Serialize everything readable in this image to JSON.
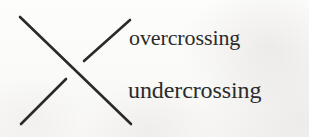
{
  "figure": {
    "name": "crossing-diagram",
    "caption_absent": true,
    "background_color": "#fbfbfa",
    "ink_color": "#2a2a2a"
  },
  "diagram": {
    "type": "knot-crossing",
    "crossing_point": {
      "x": 75,
      "y": 70
    },
    "strands": [
      {
        "id": "overcrossing-strand",
        "role": "overcrossing",
        "direction": "upper-left-to-lower-right",
        "start": {
          "x": 20,
          "y": 17
        },
        "end": {
          "x": 131,
          "y": 124
        },
        "broken": false,
        "stroke_width": 2.6,
        "color": "#2a2a2a"
      },
      {
        "id": "undercrossing-strand",
        "role": "undercrossing",
        "direction": "upper-right-to-lower-left",
        "start": {
          "x": 130,
          "y": 20
        },
        "end": {
          "x": 21,
          "y": 124
        },
        "broken": true,
        "break_start": {
          "x": 84,
          "y": 61
        },
        "break_end": {
          "x": 66,
          "y": 79
        },
        "stroke_width": 2.6,
        "color": "#2a2a2a"
      }
    ]
  },
  "labels": {
    "overcrossing": "overcrossing",
    "undercrossing": "undercrossing"
  }
}
